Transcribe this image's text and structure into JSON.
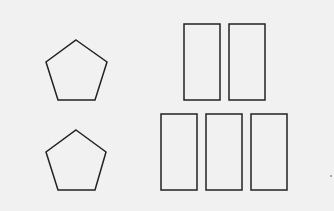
{
  "canvas": {
    "width": 334,
    "height": 211,
    "background": "#f1f1f1",
    "stroke": "#222222"
  },
  "shapes": {
    "pentagons": [
      {
        "points": "76,40 107,62 95,100 58,100 46,62"
      },
      {
        "points": "76,130 106,152 95,190 58,190 46,152"
      }
    ],
    "rectangles": [
      {
        "x": 184,
        "y": 24,
        "w": 36,
        "h": 76
      },
      {
        "x": 229,
        "y": 24,
        "w": 36,
        "h": 76
      },
      {
        "x": 161,
        "y": 114,
        "w": 36,
        "h": 76
      },
      {
        "x": 206,
        "y": 114,
        "w": 36,
        "h": 76
      },
      {
        "x": 251,
        "y": 114,
        "w": 36,
        "h": 76
      }
    ],
    "dot": {
      "cx": 331,
      "cy": 176,
      "r": 0.8
    }
  }
}
